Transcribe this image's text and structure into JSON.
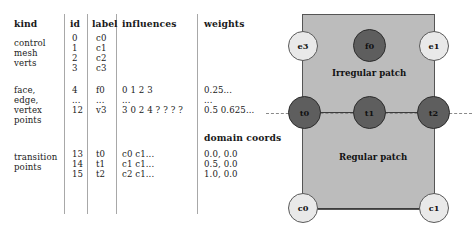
{
  "table": {
    "headers": {
      "kind": "kind",
      "id": "id",
      "label": "label",
      "influences": "influences",
      "weights": "weights"
    },
    "groups": [
      {
        "kind_lines": [
          "control",
          "mesh",
          "verts"
        ],
        "rows": [
          {
            "id": "0",
            "label": "c0",
            "influences": "",
            "weights": ""
          },
          {
            "id": "1",
            "label": "c1",
            "influences": "",
            "weights": ""
          },
          {
            "id": "2",
            "label": "c2",
            "influences": "",
            "weights": ""
          },
          {
            "id": "3",
            "label": "c3",
            "influences": "",
            "weights": ""
          }
        ]
      },
      {
        "kind_lines": [
          "face,",
          "edge,",
          "vertex",
          "points"
        ],
        "rows": [
          {
            "id": "4",
            "label": "f0",
            "influences": "0 1 2 3",
            "weights": "0.25..."
          },
          {
            "id": "...",
            "label": "...",
            "influences": "...",
            "weights": "..."
          },
          {
            "id": "12",
            "label": "v3",
            "influences": "3 0 2 4 ? ? ? ?",
            "weights": "0.5 0.625..."
          }
        ]
      },
      {
        "kind_lines": [
          "transition",
          "points"
        ],
        "subheader": "domain coords",
        "rows": [
          {
            "id": "13",
            "label": "t0",
            "influences": "c0 c1...",
            "weights": "0.0, 0.0"
          },
          {
            "id": "14",
            "label": "t1",
            "influences": "c1 c1...",
            "weights": "0.5, 0.0"
          },
          {
            "id": "15",
            "label": "t2",
            "influences": "c2 c1...",
            "weights": "1.0, 0.0"
          }
        ]
      }
    ]
  },
  "diagram": {
    "patches": [
      {
        "name": "irregular",
        "label": "Irregular patch"
      },
      {
        "name": "regular",
        "label": "Regular patch"
      }
    ],
    "nodes": [
      {
        "id": "e3",
        "label": "e3",
        "style": "light"
      },
      {
        "id": "f0",
        "label": "f0",
        "style": "dark"
      },
      {
        "id": "e1",
        "label": "e1",
        "style": "light"
      },
      {
        "id": "t0",
        "label": "t0",
        "style": "dark"
      },
      {
        "id": "t1",
        "label": "t1",
        "style": "dark"
      },
      {
        "id": "t2",
        "label": "t2",
        "style": "dark"
      },
      {
        "id": "c0",
        "label": "c0",
        "style": "light"
      },
      {
        "id": "c1",
        "label": "c1",
        "style": "light"
      }
    ],
    "colors": {
      "patch_fill": "#bcbcbc",
      "patch_border": "#555555",
      "node_light": "#e9e9e9",
      "node_dark": "#5e5e5e",
      "edge": "#3c3c3c",
      "dash": "#8a8a8a"
    }
  }
}
